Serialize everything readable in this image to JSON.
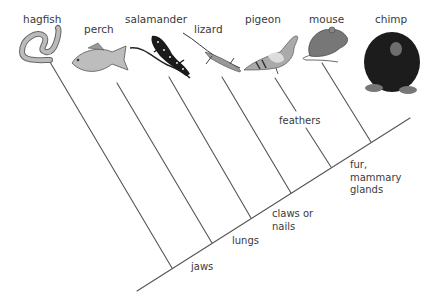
{
  "diagram": {
    "type": "cladogram",
    "taxa": [
      {
        "name": "hagfish",
        "icon": "hagfish-icon"
      },
      {
        "name": "perch",
        "icon": "fish-icon"
      },
      {
        "name": "salamander",
        "icon": "salamander-icon"
      },
      {
        "name": "lizard",
        "icon": "lizard-icon"
      },
      {
        "name": "pigeon",
        "icon": "bird-icon"
      },
      {
        "name": "mouse",
        "icon": "mouse-icon"
      },
      {
        "name": "chimp",
        "icon": "chimpanzee-icon"
      }
    ],
    "traits": [
      {
        "label": "jaws"
      },
      {
        "label": "lungs"
      },
      {
        "label": "claws or\nnails"
      },
      {
        "label": "feathers"
      },
      {
        "label": "fur,\nmammary\nglands"
      }
    ],
    "colors": {
      "line": "#555555",
      "text": "#3a3a3a"
    }
  }
}
